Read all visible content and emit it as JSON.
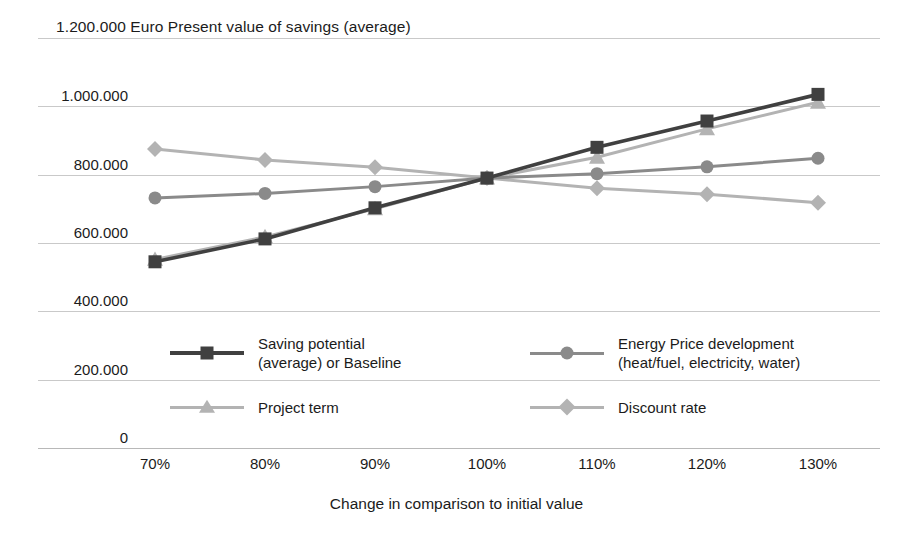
{
  "chart_data": {
    "type": "line",
    "title": "1.200.000 Euro Present value of savings (average)",
    "title_value_prefix": "1.200.000",
    "xlabel": "Change in comparison to initial value",
    "ylabel": "",
    "categories": [
      "70%",
      "80%",
      "90%",
      "100%",
      "110%",
      "120%",
      "130%"
    ],
    "ylim": [
      0,
      1200000
    ],
    "yticks": [
      "0",
      "200.000",
      "400.000",
      "600.000",
      "800.000",
      "1.000.000",
      "1.200.000"
    ],
    "ytick_values": [
      0,
      200000,
      400000,
      600000,
      800000,
      1000000,
      1200000
    ],
    "grid": true,
    "legend_position": "inside-bottom",
    "series": [
      {
        "name": "Saving potential\n(average) or Baseline",
        "marker": "square",
        "color": "#404040",
        "values": [
          545000,
          612000,
          703000,
          790000,
          880000,
          957000,
          1035000
        ]
      },
      {
        "name": "Energy Price development\n(heat/fuel, electricity, water)",
        "marker": "circle",
        "color": "#8a8a8a",
        "values": [
          732000,
          745000,
          765000,
          790000,
          803000,
          823000,
          848000
        ]
      },
      {
        "name": "Project term",
        "marker": "triangle",
        "color": "#b3b3b3",
        "values": [
          552000,
          618000,
          700000,
          790000,
          851000,
          934000,
          1012000
        ]
      },
      {
        "name": "Discount rate",
        "marker": "diamond",
        "color": "#b3b3b3",
        "values": [
          875000,
          843000,
          822000,
          790000,
          760000,
          743000,
          718000
        ]
      }
    ]
  },
  "legend": {
    "entries": [
      {
        "label": "Saving potential\n(average) or Baseline",
        "marker": "square",
        "color": "#404040"
      },
      {
        "label": "Energy Price development\n(heat/fuel, electricity, water)",
        "marker": "circle",
        "color": "#8a8a8a"
      },
      {
        "label": "Project term",
        "marker": "triangle",
        "color": "#b3b3b3"
      },
      {
        "label": "Discount rate",
        "marker": "diamond",
        "color": "#b3b3b3"
      }
    ]
  },
  "colors": {
    "gridline": "#c9c9c9",
    "text": "#1b1b1b",
    "background": "#ffffff"
  }
}
